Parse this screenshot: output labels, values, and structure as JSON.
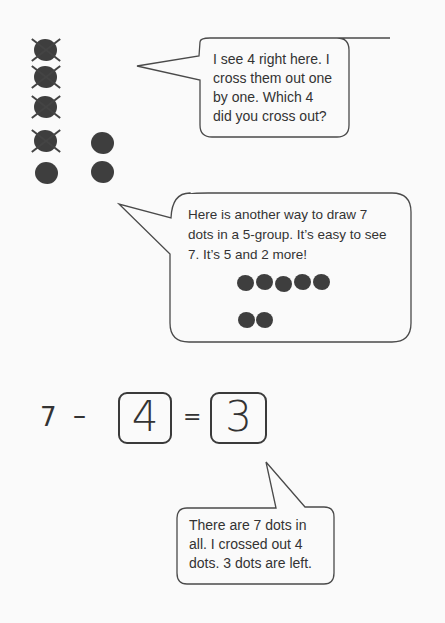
{
  "crossed_dots_panel": {
    "left_column_count": 5,
    "right_column_count": 2,
    "crossed_out_count": 4
  },
  "bubble_1": {
    "lines": [
      "I see 4 right here.  I",
      "cross them out one",
      "by one.  Which 4",
      "did you cross out?"
    ]
  },
  "bubble_2": {
    "lines": [
      "Here is another way to draw 7",
      "dots in a 5-group.  It’s easy to see",
      "7.  It’s 5 and 2 more!"
    ],
    "five_group_top_row": 5,
    "five_group_bottom_row": 2
  },
  "equation": {
    "minuend": "7",
    "operator": "–",
    "subtrahend": "4",
    "equals": "=",
    "difference": "3"
  },
  "bubble_3": {
    "lines": [
      "There are 7 dots in",
      "all.  I crossed out 4",
      "dots.  3 dots are left."
    ]
  },
  "colors": {
    "background": "#fafafa",
    "dot": "#3e3e3e",
    "outline": "#444444"
  }
}
